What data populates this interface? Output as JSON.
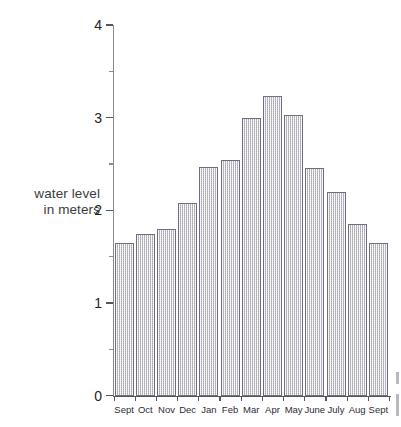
{
  "chart_data": {
    "type": "bar",
    "title": "",
    "subtitle": "",
    "xlabel": "",
    "ylabel": "water level in meters",
    "ylabel_lines": [
      "water level",
      "in meters"
    ],
    "categories": [
      "Sept",
      "Oct",
      "Nov",
      "Dec",
      "Jan",
      "Feb",
      "Mar",
      "Apr",
      "May",
      "June",
      "July",
      "Aug",
      "Sept"
    ],
    "values": [
      1.65,
      1.74,
      1.8,
      2.08,
      2.47,
      2.54,
      3.0,
      3.23,
      3.03,
      2.46,
      2.2,
      1.85,
      1.65
    ],
    "ylim": [
      0,
      4
    ],
    "y_ticks": [
      0,
      1,
      2,
      3,
      4
    ],
    "y_tick_labels": [
      "0",
      "1",
      "2",
      "3",
      "4"
    ],
    "y_minor_ticks": [
      0.5,
      1.5,
      2.5,
      3.5
    ],
    "grid": false,
    "legend": null,
    "legend_position": "none",
    "bar_fill_color": "#c9c9cd",
    "bar_edge_color": "#6d6d84",
    "axis_color": "#55555f",
    "text_color": "#2c2c38"
  }
}
